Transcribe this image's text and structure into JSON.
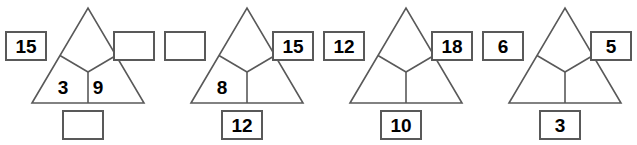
{
  "worksheet": {
    "background_color": "#ffffff",
    "line_color": "#595959",
    "text_color": "#000000",
    "puzzles": [
      {
        "id": "puzzle-1",
        "left_box": "15",
        "right_box": "",
        "bottom_box": "",
        "cell_left": "3",
        "cell_right": "9",
        "cell_top": ""
      },
      {
        "id": "puzzle-2",
        "left_box": "",
        "right_box": "15",
        "bottom_box": "12",
        "cell_left": "8",
        "cell_right": "",
        "cell_top": ""
      },
      {
        "id": "puzzle-3",
        "left_box": "12",
        "right_box": "18",
        "bottom_box": "10",
        "cell_left": "",
        "cell_right": "",
        "cell_top": ""
      },
      {
        "id": "puzzle-4",
        "left_box": "6",
        "right_box": "5",
        "bottom_box": "3",
        "cell_left": "",
        "cell_right": "",
        "cell_top": ""
      }
    ]
  }
}
